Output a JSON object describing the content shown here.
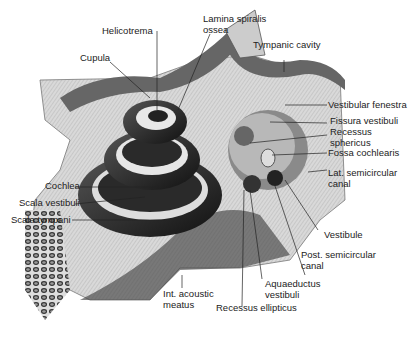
{
  "figure": {
    "labels": {
      "helicotrema": "Helicotrema",
      "lamina_spiralis_ossea": "Lamina spiralis\nossea",
      "cupula": "Cupula",
      "tympanic_cavity": "Tympanic cavity",
      "vestibular_fenestra": "Vestibular fenestra",
      "fissura_vestibuli": "Fissura vestibuli",
      "recessus_sphericus": "Recessus\nsphericus",
      "fossa_cochlearis": "Fossa cochlearis",
      "lat_semicircular_canal": "Lat. semicircular\ncanal",
      "cochlea": "Cochlea",
      "scala_vestibuli": "Scala vestibuli",
      "scala_tympani": "Scala tympani",
      "vestibule": "Vestibule",
      "post_semicircular_canal": "Post. semicircular\ncanal",
      "aquaeductus_vestibuli": "Aquaeductus\nvestibuli",
      "int_acoustic_meatus": "Int. acoustic\nmeatus",
      "recessus_ellipticus": "Recessus ellipticus"
    }
  }
}
